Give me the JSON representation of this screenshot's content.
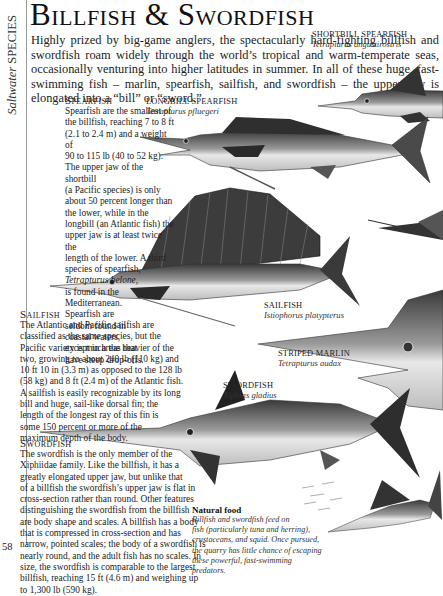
{
  "page": {
    "section_tab": {
      "italic": "Saltwater",
      "caps": "SPECIES"
    },
    "title": "Billfish & Swordfish",
    "page_number": "58",
    "intro": "Highly prized by big-game anglers, the spectacularly hard-fighting billfish and swordfish roam widely through the world’s tropical and warm-temperate seas, occasionally venturing into higher latitudes in summer. In all of these huge, fast-swimming fish – marlin, spearfish, sailfish, and swordfish – the upper jaw is elongated into a “bill” or “sword.”"
  },
  "sections": {
    "spearfish": {
      "heading": "Spearfish",
      "lines": [
        "Spearfish are the smallest of",
        "the billfish, reaching 7 to 8 ft",
        "(2.1 to 2.4 m) and a weight of",
        "90 to 115 lb (40 to 52 kg).",
        "The upper jaw of the shortbill",
        "(a Pacific species) is only",
        "about 50 percent longer than",
        "the lower, while in the",
        "longbill (an Atlantic fish) the",
        "upper jaw is at least twice the",
        "length of the lower. A third",
        "species of spearfish,",
        "Tetrapturus belone,",
        "is found in the",
        "Mediterranean.",
        "Spearfish are",
        "seldom found in",
        "coastal waters,",
        "except in areas that",
        "have steep drop-offs."
      ]
    },
    "sailfish": {
      "heading": "Sailfish",
      "lines": [
        "The Atlantic and Pacific sailfish are",
        "classified as the same species, but the",
        "Pacific variety is much the heavier of the",
        "two, growing to about 240 lb (110 kg) and",
        "10 ft 10 in (3.3 m) as opposed to the 128 lb",
        "(58 kg) and 8 ft (2.4 m) of the Atlantic fish.",
        "A sailfish is easily recognizable by its long",
        "bill and huge, sail-like dorsal fin; the",
        "length of the longest ray of this fin is",
        "some 150 percent or more of the",
        "maximum depth of the body."
      ]
    },
    "swordfish": {
      "heading": "Swordfish",
      "lines": [
        "The swordfish is the only member of the",
        "Xiphiidae family. Like the billfish, it has a",
        "greatly elongated upper jaw, but unlike that",
        "of a billfish the swordfish’s upper jaw is flat in",
        "cross-section rather than round. Other features",
        "distinguishing the swordfish from the billfish",
        "are body shape and scales. A billfish has a body",
        "that is compressed in cross-section and has",
        "narrow, pointed scales; the body of a swordfish is",
        "nearly round, and the adult fish has no scales. In",
        "size, the swordfish is comparable to the largest",
        "billfish, reaching 15 ft (4.6 m) and weighing up",
        "to 1,300 lb (590 kg)."
      ]
    }
  },
  "captions": {
    "shortbill": {
      "name": "SHORTBILL SPEARFISH",
      "latin": "Tetrapturus angustirostris"
    },
    "longbill": {
      "name": "LONGBILL SPEARFISH",
      "latin": "Tetrapturus pfluegeri"
    },
    "sailfish": {
      "name": "SAILFISH",
      "latin": "Istiophorus platypterus"
    },
    "striped_marlin": {
      "name": "STRIPED MARLIN",
      "latin": "Tetrapturus audax"
    },
    "swordfish": {
      "name": "SWORDFISH",
      "latin": "Xiphias gladius"
    }
  },
  "natural_food": {
    "heading": "Natural food",
    "lines": [
      "Billfish and swordfish feed on",
      "fish (particularly tuna and herring),",
      "crustaceans, and squid. Once pursued,",
      "the quarry has little chance of escaping",
      "these powerful, fast-swimming predators."
    ]
  }
}
